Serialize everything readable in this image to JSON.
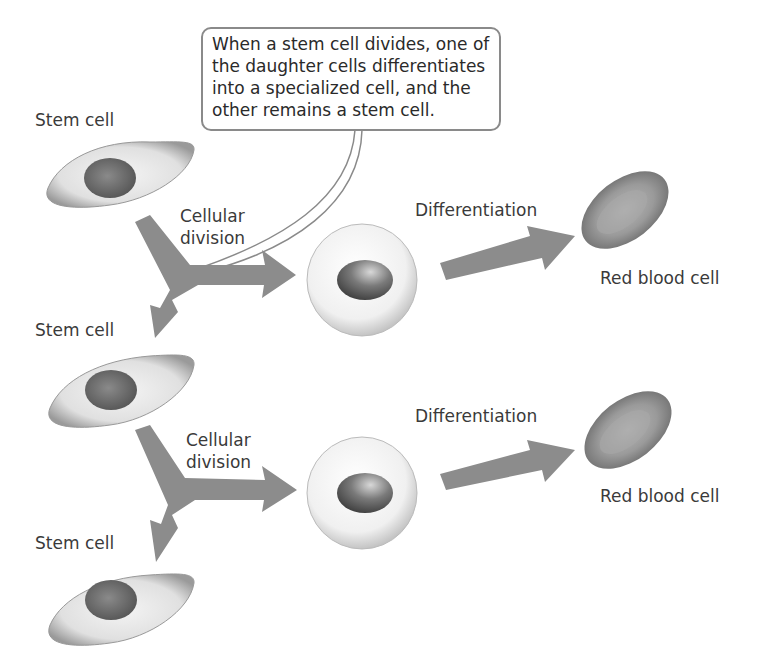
{
  "callout": {
    "text": "When a stem cell divides, one of\nthe daughter cells differentiates\ninto a specialized cell, and the\nother remains a stem cell."
  },
  "labels": {
    "stem_cell_1": "Stem cell",
    "stem_cell_2": "Stem cell",
    "stem_cell_3": "Stem cell",
    "division_1_line1": "Cellular",
    "division_1_line2": "division",
    "division_2_line1": "Cellular",
    "division_2_line2": "division",
    "differentiation_1": "Differentiation",
    "differentiation_2": "Differentiation",
    "rbc_1": "Red blood cell",
    "rbc_2": "Red blood cell"
  },
  "colors": {
    "arrow": "#8c8c8c",
    "cell_body": "#e8e8e8",
    "nucleus": "#777777",
    "text": "#3a3a3a"
  }
}
